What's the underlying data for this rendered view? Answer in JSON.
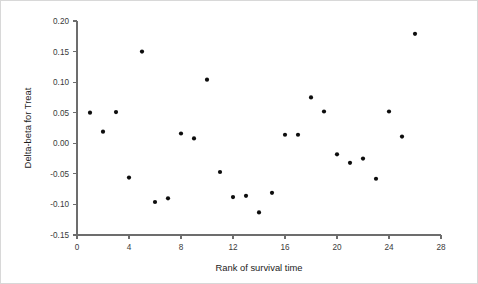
{
  "figure": {
    "background_color": "#ffffff",
    "axis_color": "#6d6d6d",
    "point_color": "#0d0d0d",
    "text_color": "#1c1c1c"
  },
  "chart_data": {
    "type": "scatter",
    "title": "",
    "xlabel": "Rank of survival time",
    "ylabel": "Delta-beta for Treat",
    "xlim": [
      0,
      28
    ],
    "ylim": [
      -0.15,
      0.2
    ],
    "xticks": [
      0,
      4,
      8,
      12,
      16,
      20,
      24,
      28
    ],
    "xtick_labels": [
      "0",
      "4",
      "8",
      "12",
      "16",
      "20",
      "24",
      "28"
    ],
    "yticks": [
      -0.15,
      -0.1,
      -0.05,
      0.0,
      0.05,
      0.1,
      0.15,
      0.2
    ],
    "ytick_labels": [
      "-0.15",
      "-0.10",
      "-0.05",
      "0.00",
      "0.05",
      "0.10",
      "0.15",
      "0.20"
    ],
    "grid": false,
    "legend": null,
    "marker": "circle",
    "marker_size": 3,
    "x": [
      1,
      2,
      3,
      4,
      5,
      6,
      7,
      8,
      9,
      10,
      11,
      12,
      13,
      14,
      15,
      16,
      17,
      18,
      19,
      20,
      21,
      22,
      23,
      24,
      25,
      26
    ],
    "y": [
      0.05,
      0.019,
      0.051,
      -0.056,
      0.15,
      -0.096,
      -0.09,
      0.016,
      0.008,
      0.104,
      -0.047,
      -0.088,
      -0.086,
      -0.113,
      -0.081,
      0.014,
      0.014,
      0.075,
      0.052,
      -0.018,
      -0.032,
      -0.025,
      -0.058,
      0.052,
      0.011,
      0.179
    ],
    "series": [
      {
        "name": "Delta-beta for Treat",
        "points": [
          {
            "x": 1,
            "y": 0.05
          },
          {
            "x": 2,
            "y": 0.019
          },
          {
            "x": 3,
            "y": 0.051
          },
          {
            "x": 4,
            "y": -0.056
          },
          {
            "x": 5,
            "y": 0.15
          },
          {
            "x": 6,
            "y": -0.096
          },
          {
            "x": 7,
            "y": -0.09
          },
          {
            "x": 8,
            "y": 0.016
          },
          {
            "x": 9,
            "y": 0.008
          },
          {
            "x": 10,
            "y": 0.104
          },
          {
            "x": 11,
            "y": -0.047
          },
          {
            "x": 12,
            "y": -0.088
          },
          {
            "x": 13,
            "y": -0.086
          },
          {
            "x": 14,
            "y": -0.113
          },
          {
            "x": 15,
            "y": -0.081
          },
          {
            "x": 16,
            "y": 0.014
          },
          {
            "x": 17,
            "y": 0.014
          },
          {
            "x": 18,
            "y": 0.075
          },
          {
            "x": 19,
            "y": 0.052
          },
          {
            "x": 20,
            "y": -0.018
          },
          {
            "x": 21,
            "y": -0.032
          },
          {
            "x": 22,
            "y": -0.025
          },
          {
            "x": 23,
            "y": -0.058
          },
          {
            "x": 24,
            "y": 0.052
          },
          {
            "x": 25,
            "y": 0.011
          },
          {
            "x": 26,
            "y": 0.179
          }
        ]
      }
    ]
  }
}
